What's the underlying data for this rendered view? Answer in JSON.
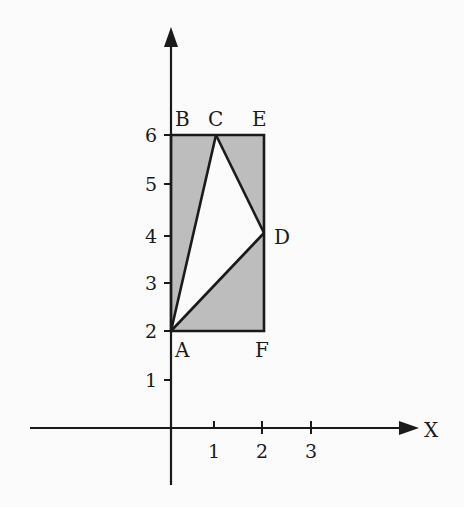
{
  "figure": {
    "type": "coordinate-geometry-diagram",
    "colors": {
      "background": "#fbfbfb",
      "shade": "#bdbdbd",
      "unshaded_triangle": "#fbfbfb",
      "ink": "#1a1a1a"
    },
    "axes": {
      "x_label": "X",
      "x_ticks": [
        "1",
        "2",
        "3"
      ],
      "y_ticks": [
        "1",
        "2",
        "3",
        "4",
        "5",
        "6"
      ]
    },
    "points": [
      {
        "name": "A",
        "x": 0,
        "y": 2
      },
      {
        "name": "B",
        "x": 0,
        "y": 6
      },
      {
        "name": "C",
        "x": 1,
        "y": 6
      },
      {
        "name": "E",
        "x": 2,
        "y": 6
      },
      {
        "name": "D",
        "x": 2,
        "y": 4
      },
      {
        "name": "F",
        "x": 2,
        "y": 2
      }
    ],
    "labels": {
      "A": "A",
      "B": "B",
      "C": "C",
      "D": "D",
      "E": "E",
      "F": "F"
    },
    "rectangle": [
      "A",
      "B",
      "E",
      "F"
    ],
    "unshaded_triangle": [
      "A",
      "C",
      "D"
    ],
    "shaded_regions": [
      "triangle ABC",
      "triangle CED",
      "triangle ADF"
    ]
  }
}
